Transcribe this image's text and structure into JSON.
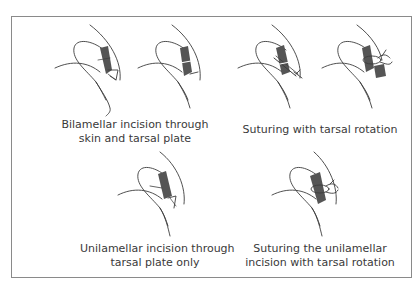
{
  "figure": {
    "panels": [
      {
        "id": "bilamellar-incision",
        "caption_lines": [
          "Bilamellar incision through",
          "skin and tarsal plate"
        ],
        "drawings": 2
      },
      {
        "id": "suturing-tarsal-rotation",
        "caption_lines": [
          "Suturing with tarsal rotation"
        ],
        "drawings": 2
      },
      {
        "id": "unilamellar-incision",
        "caption_lines": [
          "Unilamellar incision through",
          "tarsal plate only"
        ],
        "drawings": 1
      },
      {
        "id": "suturing-unilamellar",
        "caption_lines": [
          "Suturing the unilamellar",
          "incision with tarsal rotation"
        ],
        "drawings": 1
      }
    ],
    "colors": {
      "line": "#3c3c3c",
      "tarsal_fill": "#555555",
      "frame": "#8a8a8a",
      "text": "#3a3a3a"
    }
  }
}
